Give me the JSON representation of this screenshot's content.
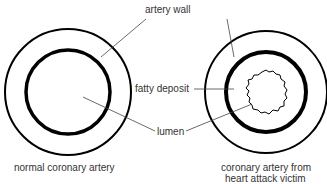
{
  "labels": {
    "artery_wall": "artery wall",
    "fatty_deposit": "fatty deposit",
    "lumen": "lumen"
  },
  "captions": {
    "normal": "normal coronary artery",
    "victim_line1": "coronary artery from",
    "victim_line2": "heart attack victim"
  },
  "colors": {
    "stroke": "#000000",
    "leader": "#444444",
    "text": "#333333",
    "background": "#ffffff"
  }
}
